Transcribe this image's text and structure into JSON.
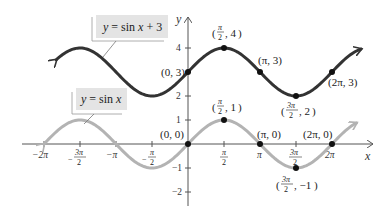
{
  "chart_data": {
    "type": "line",
    "title": "",
    "xlabel": "x",
    "ylabel": "y",
    "xlim": [
      -6.6,
      7.6
    ],
    "ylim": [
      -2.5,
      5.2
    ],
    "grid": false,
    "x_ticks": [
      "-2π",
      "-3π/2",
      "-π",
      "-π/2",
      "π/2",
      "π",
      "3π/2",
      "2π"
    ],
    "y_ticks": [
      "4",
      "2",
      "1",
      "-1",
      "-2"
    ],
    "series": [
      {
        "name": "y = sin x + 3",
        "color": "#333333",
        "function": "sin(x)+3",
        "points": [
          {
            "label": "(0, 3)",
            "x": 0,
            "y": 3
          },
          {
            "label": "(π/2, 4)",
            "x": 1.5708,
            "y": 4
          },
          {
            "label": "(π, 3)",
            "x": 3.1416,
            "y": 3
          },
          {
            "label": "(3π/2, 2)",
            "x": 4.7124,
            "y": 2
          },
          {
            "label": "(2π, 3)",
            "x": 6.2832,
            "y": 3
          }
        ]
      },
      {
        "name": "y = sin x",
        "color": "#b3b3b3",
        "function": "sin(x)",
        "points": [
          {
            "label": "(0, 0)",
            "x": 0,
            "y": 0
          },
          {
            "label": "(π/2, 1)",
            "x": 1.5708,
            "y": 1
          },
          {
            "label": "(π, 0)",
            "x": 3.1416,
            "y": 0
          },
          {
            "label": "(3π/2, -1)",
            "x": 4.7124,
            "y": -1
          },
          {
            "label": "(2π, 0)",
            "x": 6.2832,
            "y": 0
          }
        ]
      }
    ],
    "legend": [
      {
        "text": "y = sin x + 3",
        "series": 0
      },
      {
        "text": "y = sin x",
        "series": 1
      }
    ]
  },
  "labels": {
    "x_axis": "x",
    "y_axis": "y",
    "legend_top": "y = sin x + 3",
    "legend_bottom": "y = sin x",
    "y_tick_4": "4",
    "y_tick_2": "2",
    "y_tick_1": "1",
    "y_tick_m1": "−1",
    "y_tick_m2": "−2",
    "x_tick_m2pi": "−2π",
    "x_tick_mpi": "−π",
    "x_tick_pi": "π",
    "x_tick_2pi": "2π",
    "pt_0_3": "(0, 3)",
    "pt_pi_3": "(π, 3)",
    "pt_2pi_3": "(2π, 3)",
    "pt_0_0": "(0, 0)",
    "pt_pi_0": "(π, 0)",
    "pt_2pi_0": "(2π, 0)"
  }
}
